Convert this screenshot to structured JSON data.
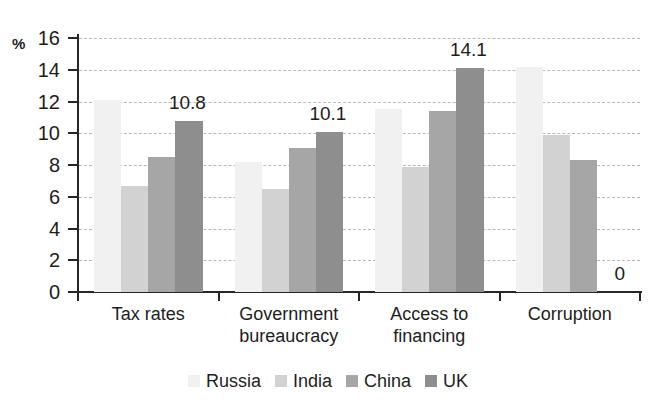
{
  "chart_data": {
    "type": "bar",
    "title": "",
    "subtitle": "",
    "xlabel": "",
    "ylabel": "%",
    "ylim": [
      0,
      16
    ],
    "ytick_values": [
      16,
      14,
      12,
      10,
      8,
      6,
      4,
      2,
      0
    ],
    "ytick_labels": [
      "16",
      "14",
      "12",
      "10",
      "8",
      "6",
      "4",
      "2",
      "0"
    ],
    "grid": true,
    "grid_style": "dashed-horizontal",
    "legend_position": "bottom-center",
    "categories": [
      "Tax rates",
      "Government bureaucracy",
      "Access to financing",
      "Corruption"
    ],
    "category_lines": [
      [
        "Tax rates"
      ],
      [
        "Government",
        "bureaucracy"
      ],
      [
        "Access to",
        "financing"
      ],
      [
        "Corruption"
      ]
    ],
    "series": [
      {
        "name": "Russia",
        "color": "#f1f1f1",
        "values": [
          12.1,
          8.2,
          11.5,
          14.2
        ]
      },
      {
        "name": "India",
        "color": "#d2d2d2",
        "values": [
          6.7,
          6.5,
          7.9,
          9.9
        ]
      },
      {
        "name": "China",
        "color": "#a6a6a6",
        "values": [
          8.5,
          9.1,
          11.4,
          8.3
        ]
      },
      {
        "name": "UK",
        "color": "#8e8e8e",
        "values": [
          10.8,
          10.1,
          14.1,
          0
        ]
      }
    ],
    "annotations": [
      {
        "text": "10.8",
        "series": "UK",
        "category": "Tax rates",
        "value": 10.8
      },
      {
        "text": "10.1",
        "series": "UK",
        "category": "Government bureaucracy",
        "value": 10.1
      },
      {
        "text": "14.1",
        "series": "UK",
        "category": "Access to financing",
        "value": 14.1
      },
      {
        "text": "0",
        "series": "UK",
        "category": "Corruption",
        "value": 0
      }
    ]
  },
  "legend": {
    "items": [
      {
        "label": "Russia",
        "color": "#f1f1f1"
      },
      {
        "label": "India",
        "color": "#d2d2d2"
      },
      {
        "label": "China",
        "color": "#a6a6a6"
      },
      {
        "label": "UK",
        "color": "#8e8e8e"
      }
    ]
  },
  "axis": {
    "y_unit_label": "%"
  }
}
